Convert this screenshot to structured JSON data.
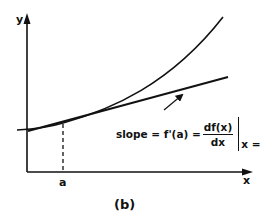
{
  "figure": {
    "caption": "(b)",
    "axes": {
      "x_label": "x",
      "y_label": "y"
    },
    "tick_label": "a",
    "formula": {
      "lhs": "slope = f'(a) =",
      "numerator": "df(x)",
      "denominator": "dx",
      "evaluated_at": "x = a"
    },
    "elements": [
      "curve f(x)",
      "tangent line at x = a",
      "dashed vertical line at a",
      "arrow pointing to tangent line"
    ],
    "colors": {
      "ink": "#111111",
      "background": "#ffffff"
    }
  }
}
